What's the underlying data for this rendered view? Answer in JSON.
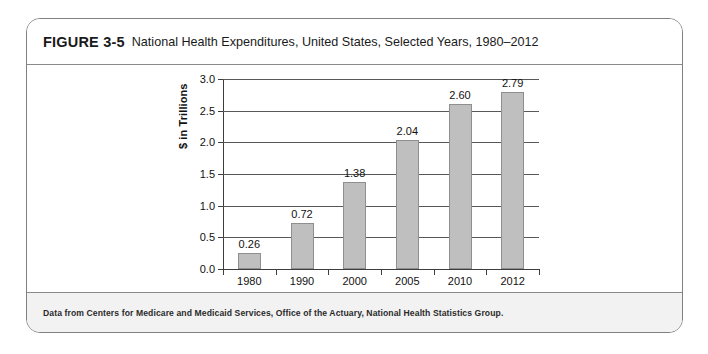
{
  "figure": {
    "label": "FIGURE 3-5",
    "title": "National Health Expenditures, United States, Selected Years, 1980–2012",
    "source_note": "Data from Centers for Medicare and Medicaid Services, Office of the Actuary, National Health Statistics Group."
  },
  "colors": {
    "bar_fill": "#bfbfbf",
    "bar_stroke": "#8f8f8f",
    "axis": "#3d3d3d",
    "gridline": "#585858",
    "card_border": "#808080",
    "footer_background": "#f2f2f2",
    "text": "#111111"
  },
  "chart_data": {
    "type": "bar",
    "title": "National Health Expenditures, United States, Selected Years, 1980–2012",
    "categories": [
      "1980",
      "1990",
      "2000",
      "2005",
      "2010",
      "2012"
    ],
    "values": [
      0.26,
      0.72,
      1.38,
      2.04,
      2.6,
      2.79
    ],
    "value_labels": [
      "0.26",
      "0.72",
      "1.38",
      "2.04",
      "2.60",
      "2.79"
    ],
    "xlabel": "",
    "ylabel": "$ in Trillions",
    "ylim": [
      0.0,
      3.0
    ],
    "ytick_values": [
      0.0,
      0.5,
      1.0,
      1.5,
      2.0,
      2.5,
      3.0
    ],
    "ytick_labels": [
      "0.0",
      "0.5",
      "1.0",
      "1.5",
      "2.0",
      "2.5",
      "3.0"
    ],
    "grid": true,
    "legend": null,
    "legend_position": "none",
    "series": [
      {
        "name": "National Health Expenditures",
        "values": [
          0.26,
          0.72,
          1.38,
          2.04,
          2.6,
          2.79
        ]
      }
    ]
  }
}
